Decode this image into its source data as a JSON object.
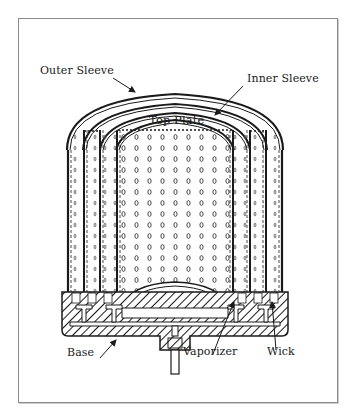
{
  "figure": {
    "type": "cross-section cutaway diagram"
  },
  "labels": {
    "outer_sleeve": "Outer Sleeve",
    "inner_sleeve": "Inner Sleeve",
    "top_plate": "Top Plate",
    "base": "Base",
    "vaporizer": "Vaporizer",
    "wick": "Wick"
  },
  "colors": {
    "line": "#1a1a1a",
    "frame": "#8a8a8a",
    "background": "#ffffff"
  }
}
